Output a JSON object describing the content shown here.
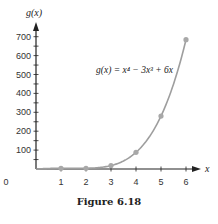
{
  "caption": "Figure 6.18",
  "colors": {
    "curve": "#9e9e9e",
    "points": "#a8a8a8",
    "axis": "#222222"
  },
  "chart_data": {
    "type": "line",
    "title": "",
    "equation": "g(x) = x⁴ − 3x³ + 6x",
    "xlabel": "x",
    "ylabel": "g(x)",
    "x": [
      1,
      2,
      3,
      4,
      5,
      6
    ],
    "values": [
      4,
      4,
      18,
      88,
      280,
      684
    ],
    "series": [
      {
        "name": "g(x) = x^4 - 3x^3 + 6x",
        "x": [
          1,
          2,
          3,
          4,
          5,
          6
        ],
        "values": [
          4,
          4,
          18,
          88,
          280,
          684
        ]
      }
    ],
    "xticks": [
      "0",
      "1",
      "2",
      "3",
      "4",
      "5",
      "6"
    ],
    "yticks": [
      "100",
      "200",
      "300",
      "400",
      "500",
      "600",
      "700"
    ],
    "xlim": [
      0,
      6.5
    ],
    "ylim": [
      0,
      750
    ],
    "grid": false,
    "legend": "none"
  }
}
